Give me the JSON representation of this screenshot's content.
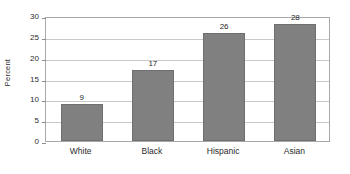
{
  "chart_data": {
    "type": "bar",
    "title": "",
    "xlabel": "",
    "ylabel": "Percent",
    "categories": [
      "White",
      "Black",
      "Hispanic",
      "Asian"
    ],
    "values": [
      9,
      17,
      26,
      28
    ],
    "value_labels": [
      "9",
      "17",
      "26",
      "28"
    ],
    "ylim": [
      0,
      30
    ],
    "y_ticks": [
      0,
      5,
      10,
      15,
      20,
      25,
      30
    ],
    "y_tick_labels": [
      "0",
      "5",
      "10",
      "15",
      "20",
      "25",
      "30"
    ],
    "grid": true,
    "legend": false,
    "legend_position": "none",
    "bar_color": "#808080",
    "bar_border_color": "#6f6f6f",
    "gridline_color": "#c9c9c9",
    "frame_color": "#a8a8a8",
    "text_color": "#2b2b2b",
    "background_color": "#ffffff"
  }
}
